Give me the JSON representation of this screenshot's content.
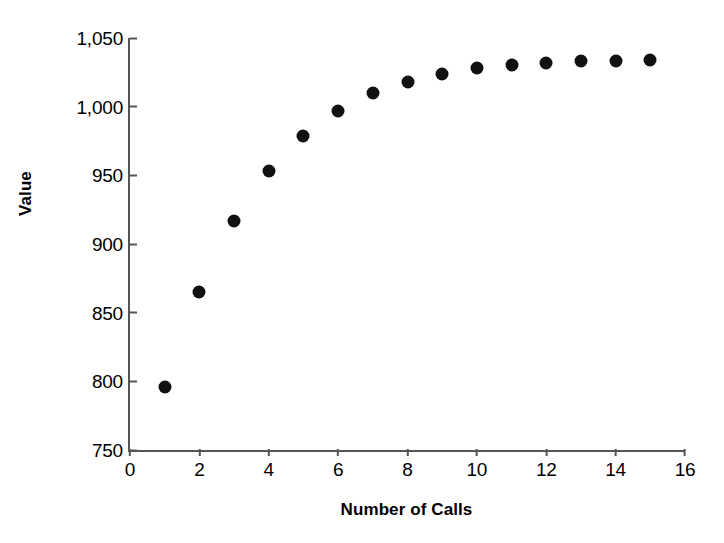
{
  "chart_data": {
    "type": "scatter",
    "title": "",
    "xlabel": "Number of Calls",
    "ylabel": "Value",
    "x": [
      1,
      2,
      3,
      4,
      5,
      6,
      7,
      8,
      9,
      10,
      11,
      12,
      13,
      14,
      15
    ],
    "values": [
      796,
      865,
      917,
      953,
      979,
      997,
      1010,
      1018,
      1024,
      1028,
      1030,
      1032,
      1033,
      1033,
      1034
    ],
    "series": [
      {
        "name": "Value",
        "values": [
          796,
          865,
          917,
          953,
          979,
          997,
          1010,
          1018,
          1024,
          1028,
          1030,
          1032,
          1033,
          1033,
          1034
        ]
      }
    ],
    "xlim": [
      0,
      16
    ],
    "ylim": [
      750,
      1050
    ],
    "xticks": [
      0,
      2,
      4,
      6,
      8,
      10,
      12,
      14,
      16
    ],
    "xtick_labels": [
      "0",
      "2",
      "4",
      "6",
      "8",
      "10",
      "12",
      "14",
      "16"
    ],
    "yticks": [
      750,
      800,
      850,
      900,
      950,
      1000,
      1050
    ],
    "ytick_labels": [
      "750",
      "800",
      "850",
      "900",
      "950",
      "1,000",
      "1,050"
    ],
    "grid": false,
    "legend": false,
    "legend_position": "none",
    "marker_color": "#111111",
    "axis_color": "#555555",
    "background_color": "#ffffff"
  }
}
